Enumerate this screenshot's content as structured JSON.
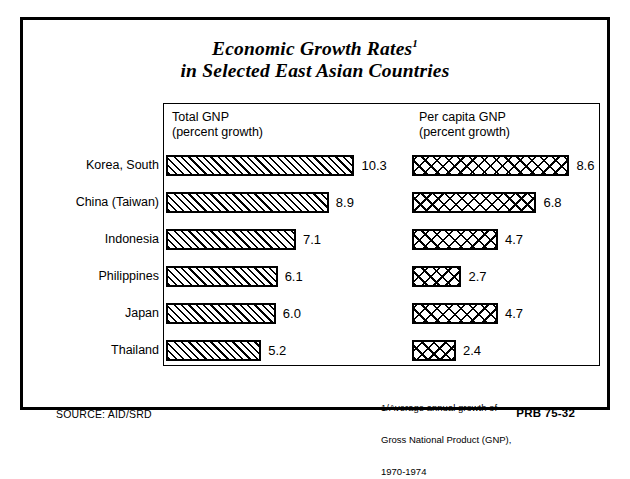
{
  "title": {
    "line1": "Economic Growth Rates",
    "superscript": "1",
    "line2": "in Selected East Asian Countries"
  },
  "columns": {
    "total": {
      "heading": "Total GNP",
      "sub": "(percent growth)"
    },
    "per_capita": {
      "heading": "Per capita GNP",
      "sub": "(percent growth)"
    }
  },
  "footnote": {
    "line1": "1/Average annual growth of",
    "line2": "Gross National Product (GNP),",
    "line3": "1970-1974"
  },
  "source": "SOURCE: AID/SRD",
  "publication_code": "PRB 75-32",
  "colors": {
    "ink": "#000000",
    "paper": "#ffffff"
  },
  "chart_data": {
    "type": "bar",
    "orientation": "horizontal",
    "subtitle": "Average annual growth of Gross National Product (GNP), 1970-1974",
    "xlabel": "percent growth",
    "ylabel": "",
    "grid": false,
    "legend_position": "column-headers",
    "categories": [
      "Korea, South",
      "China (Taiwan)",
      "Indonesia",
      "Philippines",
      "Japan",
      "Thailand"
    ],
    "series": [
      {
        "name": "Total GNP",
        "unit": "percent growth",
        "pattern": "diagonal-hatch",
        "values": [
          10.3,
          8.9,
          7.1,
          6.1,
          6.0,
          5.2
        ],
        "labels": [
          "10.3",
          "8.9",
          "7.1",
          "6.1",
          "6.0",
          "5.2"
        ]
      },
      {
        "name": "Per capita GNP",
        "unit": "percent growth",
        "pattern": "cross-hatch",
        "values": [
          8.6,
          6.8,
          4.7,
          2.7,
          4.7,
          2.4
        ],
        "labels": [
          "8.6",
          "6.8",
          "4.7",
          "2.7",
          "4.7",
          "2.4"
        ]
      }
    ],
    "xlim": [
      0,
      10.3
    ],
    "px_per_unit_total": 18.3,
    "px_per_unit_per_capita": 18.3
  }
}
